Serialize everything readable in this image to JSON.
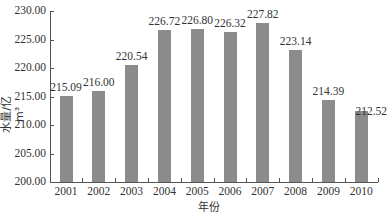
{
  "chart_data": {
    "type": "bar",
    "title": "",
    "xlabel": "年份",
    "ylabel": "水量/亿m³",
    "categories": [
      "2001",
      "2002",
      "2003",
      "2004",
      "2005",
      "2006",
      "2007",
      "2008",
      "2009",
      "2010"
    ],
    "values": [
      215.09,
      216.0,
      220.54,
      226.72,
      226.8,
      226.32,
      227.82,
      223.14,
      214.39,
      212.52
    ],
    "value_labels": [
      "215.09",
      "216.00",
      "220.54",
      "226.72",
      "226.80",
      "226.32",
      "227.82",
      "223.14",
      "214.39",
      "212.52"
    ],
    "ylim": [
      200,
      230
    ],
    "yticks": [
      "200.00",
      "205.00",
      "210.00",
      "215.00",
      "220.00",
      "225.00",
      "230.00"
    ],
    "grid": false,
    "legend": null,
    "bar_color": "#8c8c8c"
  }
}
